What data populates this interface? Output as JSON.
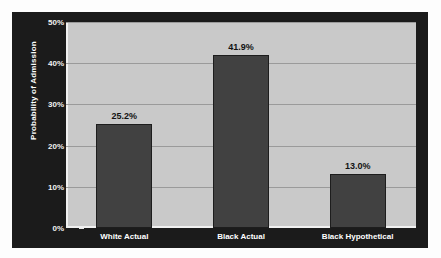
{
  "chart_data": {
    "type": "bar",
    "title": "",
    "xlabel": "",
    "ylabel": "Probability of Admission",
    "categories": [
      "White Actual",
      "Black Actual",
      "Black Hypothetical"
    ],
    "values": [
      25.2,
      41.9,
      13.0
    ],
    "value_labels": [
      "25.2%",
      "41.9%",
      "13.0%"
    ],
    "ylim": [
      0,
      50
    ],
    "ytick_values": [
      0,
      10,
      20,
      30,
      40,
      50
    ],
    "ytick_labels": [
      "0%",
      "10%",
      "20%",
      "30%",
      "40%",
      "50%"
    ],
    "grid": true,
    "legend": false,
    "legend_position": "none",
    "colors": {
      "panel_background": "#1b1b1b",
      "plot_background": "#c9c9c9",
      "bar_fill": "#414141",
      "bar_outline": "#1d1d1d",
      "gridline": "#9a9a9a",
      "axis_line": "#f0f0f0",
      "tick_label": "#f2f2f2",
      "category_label": "#ffffff",
      "value_label": "#131313"
    }
  }
}
